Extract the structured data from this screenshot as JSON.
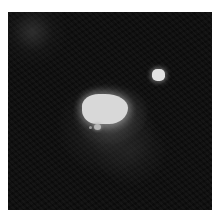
{
  "image": {
    "description": "Grayscale astronomical image: dark noisy background with a bright irregular central source, a faint knot below it, and a small compact bright point source to the upper right",
    "colors": {
      "background": "#ffffff",
      "frame": "#0a0a0a",
      "core": "#d8d8d8",
      "star": "#e2e2e2"
    },
    "objects": [
      {
        "name": "central-source",
        "x": 81,
        "y": 93,
        "w": 46,
        "h": 30
      },
      {
        "name": "knot",
        "x": 96,
        "y": 127,
        "w": 7,
        "h": 6
      },
      {
        "name": "point-source",
        "x": 152,
        "y": 69,
        "w": 13,
        "h": 12
      }
    ]
  }
}
